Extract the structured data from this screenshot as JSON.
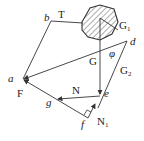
{
  "diagram": {
    "type": "force-polygon",
    "points": {
      "a": {
        "label": "a",
        "x": 23,
        "y": 79
      },
      "b": {
        "label": "b",
        "x": 51,
        "y": 21
      },
      "c": {
        "label": "",
        "x": 100,
        "y": 15
      },
      "d": {
        "label": "d",
        "x": 127,
        "y": 41
      },
      "e": {
        "label": "e",
        "x": 100,
        "y": 95
      },
      "f": {
        "label": "f",
        "x": 88,
        "y": 118
      },
      "g": {
        "label": "g",
        "x": 57,
        "y": 99
      }
    },
    "labels": {
      "a": "a",
      "b": "b",
      "d": "d",
      "e": "e",
      "f": "f",
      "g": "g",
      "T": "T",
      "F": "F",
      "G": "G",
      "G1": "G",
      "G1_sub": "1",
      "G2": "G",
      "G2_sub": "2",
      "N": "N",
      "N1": "N",
      "N1_sub": "1",
      "phi": "φ"
    },
    "edges": [
      {
        "from": "a",
        "to": "b",
        "name": "ab"
      },
      {
        "from": "b",
        "to": "body",
        "name": "T"
      },
      {
        "from": "d",
        "to": "a",
        "name": "da"
      },
      {
        "from": "c",
        "to": "e",
        "name": "G"
      },
      {
        "from": "d",
        "to": "e",
        "name": "G2"
      },
      {
        "from": "e",
        "to": "g",
        "name": "N"
      },
      {
        "from": "f",
        "to": "a",
        "name": "F"
      },
      {
        "from": "e",
        "to": "f",
        "name": "N1"
      }
    ],
    "body": {
      "name": "hatched-body",
      "label": "G1"
    }
  }
}
